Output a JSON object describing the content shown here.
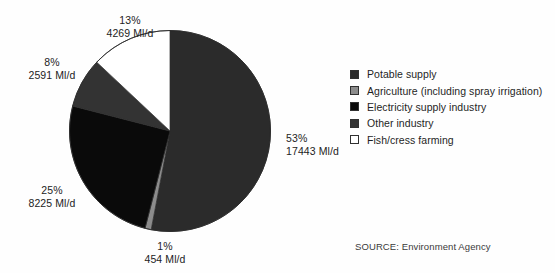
{
  "chart_data": {
    "type": "pie",
    "title": "",
    "subtitle": "",
    "xlabel": "",
    "ylabel": "",
    "unit": "Ml/d",
    "start_angle_deg": 0,
    "direction": "clockwise",
    "legend_position": "right",
    "grid": false,
    "total_value": 32982,
    "categories": [
      "Potable supply",
      "Agriculture (including spray irrigation)",
      "Electricity supply industry",
      "Other industry",
      "Fish/cress farming"
    ],
    "values": [
      17443,
      454,
      8225,
      2591,
      4269
    ],
    "percentages": [
      53,
      1,
      25,
      8,
      13
    ],
    "colors": [
      "#2b2b2b",
      "#8c8c8c",
      "#0a0a0a",
      "#333333",
      "#ffffff"
    ],
    "slices": [
      {
        "label": "Potable supply",
        "percent_text": "53%",
        "value_text": "17443 Ml/d",
        "percent": 53,
        "value": 17443,
        "color": "#2b2b2b"
      },
      {
        "label": "Agriculture (including spray irrigation)",
        "percent_text": "1%",
        "value_text": "454 Ml/d",
        "percent": 1,
        "value": 454,
        "color": "#8c8c8c"
      },
      {
        "label": "Electricity supply industry",
        "percent_text": "25%",
        "value_text": "8225 Ml/d",
        "percent": 25,
        "value": 8225,
        "color": "#0a0a0a"
      },
      {
        "label": "Other industry",
        "percent_text": "8%",
        "value_text": "2591 Ml/d",
        "percent": 8,
        "value": 2591,
        "color": "#333333"
      },
      {
        "label": "Fish/cress farming",
        "percent_text": "13%",
        "value_text": "4269 Ml/d",
        "percent": 13,
        "value": 4269,
        "color": "#ffffff"
      }
    ],
    "annotations": [
      "SOURCE: Environment Agency"
    ]
  },
  "labels": {
    "potable": {
      "percent": "53%",
      "amount": "17443 Ml/d"
    },
    "agriculture": {
      "percent": "1%",
      "amount": "454 Ml/d"
    },
    "electricity": {
      "percent": "25%",
      "amount": "8225 Ml/d"
    },
    "other": {
      "percent": "8%",
      "amount": "2591 Ml/d"
    },
    "fish": {
      "percent": "13%",
      "amount": "4269 Ml/d"
    }
  },
  "legend": {
    "items": [
      {
        "label": "Potable supply",
        "color": "#2b2b2b",
        "swatch": "legend-swatch-dark-gray"
      },
      {
        "label": "Agriculture (including spray irrigation)",
        "color": "#8c8c8c",
        "swatch": "legend-swatch-mid-gray"
      },
      {
        "label": "Electricity supply industry",
        "color": "#0a0a0a",
        "swatch": "legend-swatch-black"
      },
      {
        "label": "Other industry",
        "color": "#333333",
        "swatch": "legend-swatch-charcoal"
      },
      {
        "label": "Fish/cress farming",
        "color": "#ffffff",
        "swatch": "legend-swatch-white"
      }
    ]
  },
  "source": {
    "text": "SOURCE: Environment Agency"
  }
}
